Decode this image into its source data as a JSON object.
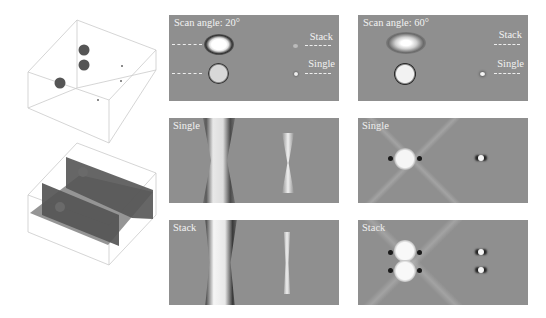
{
  "figure": {
    "left_column": {
      "top_scene": {
        "description": "3D box with three spheres and three small point scatterers"
      },
      "bottom_scene": {
        "description": "3D box with intersecting vertical and horizontal slice planes"
      }
    },
    "panels": [
      {
        "id": "top-left",
        "label": "Scan angle: 20°",
        "right_labels": [
          "Stack",
          "Single"
        ]
      },
      {
        "id": "top-right",
        "label": "Scan angle: 60°",
        "right_labels": [
          "Stack",
          "Single"
        ]
      },
      {
        "id": "mid-left",
        "label": "Single"
      },
      {
        "id": "mid-right",
        "label": "Single"
      },
      {
        "id": "bot-left",
        "label": "Stack"
      },
      {
        "id": "bot-right",
        "label": "Stack"
      }
    ],
    "colors": {
      "panel_bg": "#8f8f8f",
      "label": "#f2f2f2",
      "box_line": "#c8c8c8",
      "sphere": "#555555"
    }
  }
}
